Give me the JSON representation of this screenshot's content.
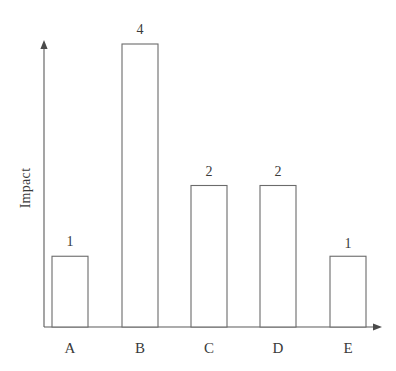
{
  "chart_data": {
    "type": "bar",
    "title": "",
    "subtitle": "",
    "xlabel": "",
    "ylabel": "Impact",
    "categories": [
      "A",
      "B",
      "C",
      "D",
      "E"
    ],
    "values": [
      1,
      4,
      2,
      2,
      1
    ],
    "value_labels": [
      "1",
      "4",
      "2",
      "2",
      "1"
    ],
    "series": [
      {
        "name": "Impact",
        "values": [
          1,
          4,
          2,
          2,
          1
        ]
      }
    ],
    "ylim": [
      0,
      4
    ],
    "xlim": [
      0,
      5
    ],
    "grid": false,
    "legend": false,
    "legend_position": "none",
    "y_axis_ticks_visible": false,
    "x_axis_ticks_visible": false,
    "axis_arrows": true,
    "annotations": [
      {
        "category": "A",
        "text": "1",
        "position": "above-bar"
      },
      {
        "category": "B",
        "text": "4",
        "position": "above-bar"
      },
      {
        "category": "C",
        "text": "2",
        "position": "above-bar"
      },
      {
        "category": "D",
        "text": "2",
        "position": "above-bar"
      },
      {
        "category": "E",
        "text": "1",
        "position": "above-bar"
      }
    ]
  },
  "style": {
    "background_color": "#ffffff",
    "bar_fill_color": "#ffffff",
    "bar_stroke_color": "#6b6b6b",
    "axis_color": "#5a5a5a",
    "text_color": "#3a3a3a"
  },
  "geometry": {
    "baseline_y": 327,
    "y_axis_x": 44,
    "y_axis_top": 42,
    "x_axis_end": 382,
    "pixels_per_unit": 70.75,
    "bar_width": 36,
    "bars": [
      {
        "category": "A",
        "x_left": 52,
        "x_center": 70,
        "top_y": 257
      },
      {
        "category": "B",
        "x_left": 122,
        "x_center": 140,
        "top_y": 44
      },
      {
        "category": "C",
        "x_left": 191,
        "x_center": 209,
        "top_y": 186
      },
      {
        "category": "D",
        "x_left": 260,
        "x_center": 278,
        "top_y": 186
      },
      {
        "category": "E",
        "x_left": 330,
        "x_center": 348,
        "top_y": 259
      }
    ],
    "value_label_y": [
      246,
      34,
      176,
      176,
      248
    ],
    "category_label_y": 353,
    "y_title_x": 30,
    "y_title_y": 188
  }
}
